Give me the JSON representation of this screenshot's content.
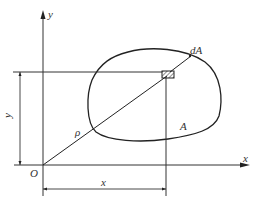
{
  "figure": {
    "type": "polar moment of area diagram",
    "labels": {
      "y_axis": "y",
      "x_axis": "x",
      "origin": "O",
      "element": "dA",
      "area": "A",
      "radius": "ρ",
      "dim_x": "x",
      "dim_y": "y"
    },
    "colors": {
      "stroke": "#222222",
      "background": "#ffffff"
    }
  }
}
